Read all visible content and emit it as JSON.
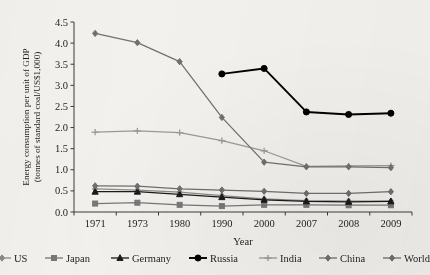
{
  "chart_data": {
    "type": "line",
    "title": "",
    "xlabel": "Year",
    "ylabel": "Energy consumption per unit of GDP (tonnes of standard coal/US$1,000)",
    "ylabel_line1": "Energy consumption per unit of GDP",
    "ylabel_line2": "(tonnes of standard coal/US$1,000)",
    "categories": [
      "1971",
      "1973",
      "1980",
      "1990",
      "2000",
      "2007",
      "2008",
      "2009"
    ],
    "ylim": [
      0,
      4.5
    ],
    "yticks": [
      "0.0",
      "0.5",
      "1.0",
      "1.5",
      "2.0",
      "2.5",
      "3.0",
      "3.5",
      "4.0",
      "4.5"
    ],
    "grid": false,
    "legend_position": "bottom",
    "series": [
      {
        "name": "US",
        "marker": "diamond",
        "color": "#8a8a8a",
        "values": [
          0.55,
          0.52,
          0.47,
          0.39,
          0.31,
          0.27,
          0.26,
          0.26
        ]
      },
      {
        "name": "Japan",
        "marker": "square",
        "color": "#777777",
        "values": [
          0.2,
          0.22,
          0.17,
          0.14,
          0.17,
          0.17,
          0.16,
          0.16
        ]
      },
      {
        "name": "Germany",
        "marker": "triangle",
        "color": "#1a1a1a",
        "values": [
          0.48,
          0.48,
          0.42,
          0.35,
          0.29,
          0.25,
          0.24,
          0.25
        ]
      },
      {
        "name": "Russia",
        "marker": "circle",
        "color": "#000000",
        "values": [
          null,
          null,
          null,
          3.27,
          3.4,
          2.37,
          2.31,
          2.34
        ]
      },
      {
        "name": "India",
        "marker": "plus",
        "color": "#9a9a9a",
        "values": [
          1.89,
          1.92,
          1.88,
          1.69,
          1.45,
          1.08,
          1.09,
          1.1
        ]
      },
      {
        "name": "China",
        "marker": "diamond",
        "color": "#707070",
        "values": [
          4.23,
          4.01,
          3.56,
          2.24,
          1.18,
          1.07,
          1.07,
          1.05
        ]
      },
      {
        "name": "World",
        "marker": "diamond",
        "color": "#6f6f6f",
        "values": [
          0.62,
          0.61,
          0.55,
          0.52,
          0.49,
          0.44,
          0.44,
          0.48
        ]
      }
    ]
  }
}
